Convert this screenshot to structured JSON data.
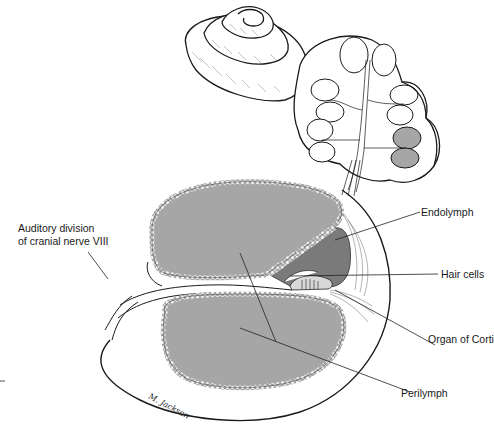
{
  "figure": {
    "labels": {
      "nerve_line1": "Auditory division",
      "nerve_line2": "of cranial nerve VIII",
      "endolymph": "Endolymph",
      "hair_cells": "Hair cells",
      "organ_of_corti": "Organ of Corti",
      "perilymph": "Perilymph"
    },
    "signature": "M. Jackson",
    "colors": {
      "perilymph_fill": "#a6a6a6",
      "endolymph_fill": "#7a7a7a",
      "stroke": "#1a1a1a",
      "background": "#ffffff"
    }
  }
}
